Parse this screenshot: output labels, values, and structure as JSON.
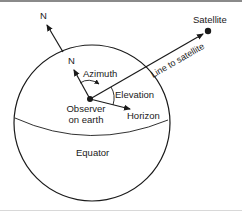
{
  "figure": {
    "labels": {
      "north_outer": "N",
      "north_inner": "N",
      "satellite": "Satellite",
      "line_to_satellite": "Line to satellite",
      "azimuth": "Azimuth",
      "elevation": "Elevation",
      "horizon": "Horizon",
      "observer_line1": "Observer",
      "observer_line2": "on earth",
      "equator": "Equator"
    },
    "colors": {
      "stroke": "#1a1a1a",
      "background": "#ffffff"
    }
  }
}
